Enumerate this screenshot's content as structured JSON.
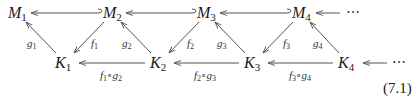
{
  "diagram": {
    "equation_number": "(7.1)",
    "ellipsis": "⋯",
    "top_row": [
      {
        "id": "M1",
        "base": "M",
        "sub": "1"
      },
      {
        "id": "M2",
        "base": "M",
        "sub": "2"
      },
      {
        "id": "M3",
        "base": "M",
        "sub": "3"
      },
      {
        "id": "M4",
        "base": "M",
        "sub": "4"
      }
    ],
    "bottom_row": [
      {
        "id": "K1",
        "base": "K",
        "sub": "1"
      },
      {
        "id": "K2",
        "base": "K",
        "sub": "2"
      },
      {
        "id": "K3",
        "base": "K",
        "sub": "3"
      },
      {
        "id": "K4",
        "base": "K",
        "sub": "4"
      }
    ],
    "edges": [
      {
        "from": "M2",
        "to": "M1",
        "type": "hook-inclusion",
        "label": ""
      },
      {
        "from": "M3",
        "to": "M2",
        "type": "hook-inclusion",
        "label": ""
      },
      {
        "from": "M4",
        "to": "M3",
        "type": "hook-inclusion",
        "label": ""
      },
      {
        "from": "⋯top",
        "to": "M4",
        "type": "arrow",
        "label": ""
      },
      {
        "from": "K1",
        "to": "M1",
        "label_base": "g",
        "label_sub": "1"
      },
      {
        "from": "M2",
        "to": "K1",
        "label_base": "f",
        "label_sub": "1"
      },
      {
        "from": "K2",
        "to": "M2",
        "label_base": "g",
        "label_sub": "2"
      },
      {
        "from": "M3",
        "to": "K2",
        "label_base": "f",
        "label_sub": "2"
      },
      {
        "from": "K3",
        "to": "M3",
        "label_base": "g",
        "label_sub": "3"
      },
      {
        "from": "M4",
        "to": "K3",
        "label_base": "f",
        "label_sub": "3"
      },
      {
        "from": "K4",
        "to": "M4",
        "label_base": "g",
        "label_sub": "4"
      },
      {
        "from": "K2",
        "to": "K1",
        "label": "f1∘g2",
        "parts": [
          "f",
          "1",
          "∘g",
          "2"
        ]
      },
      {
        "from": "K3",
        "to": "K2",
        "label": "f2∘g3",
        "parts": [
          "f",
          "2",
          "∘g",
          "3"
        ]
      },
      {
        "from": "K4",
        "to": "K3",
        "label": "f3∘g4",
        "parts": [
          "f",
          "3",
          "∘g",
          "4"
        ]
      },
      {
        "from": "⋯bottom",
        "to": "K4",
        "type": "arrow",
        "label": ""
      }
    ]
  }
}
